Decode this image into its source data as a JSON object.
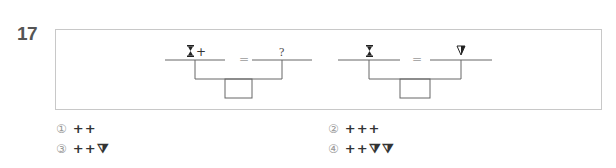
{
  "question": {
    "number": "17",
    "diagrams": [
      {
        "left_label": "⧗+",
        "equals": "=",
        "right_label": "?"
      },
      {
        "left_label": "⧗",
        "equals": "=",
        "right_label": "⧩"
      }
    ],
    "options": [
      {
        "num": "①",
        "value": "++"
      },
      {
        "num": "②",
        "value": "+++"
      },
      {
        "num": "③",
        "value": "++⧩"
      },
      {
        "num": "④",
        "value": "++⧩⧩"
      }
    ]
  },
  "colors": {
    "line": "#666666",
    "frame": "#c8c8c8",
    "number": "#555555"
  }
}
